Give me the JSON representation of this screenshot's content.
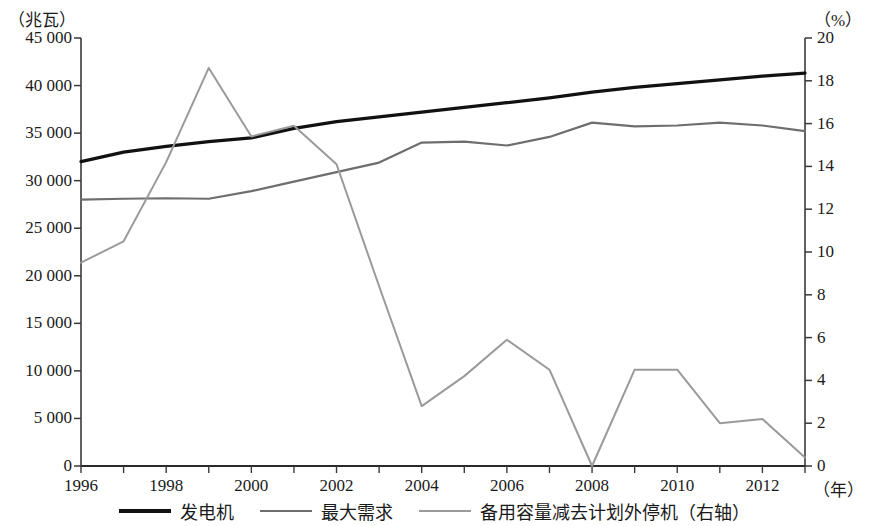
{
  "axes": {
    "left_unit": "（兆瓦）",
    "right_unit": "（%）",
    "x_unit": "（年）",
    "left_ticks": [
      "0",
      "5 000",
      "10 000",
      "15 000",
      "20 000",
      "25 000",
      "30 000",
      "35 000",
      "40 000",
      "45 000"
    ],
    "right_ticks": [
      "0",
      "2",
      "4",
      "6",
      "8",
      "10",
      "12",
      "14",
      "16",
      "18",
      "20"
    ],
    "x_ticks": [
      "1996",
      "1998",
      "2000",
      "2002",
      "2004",
      "2006",
      "2008",
      "2010",
      "2012"
    ]
  },
  "legend": {
    "items": [
      {
        "label": "发电机",
        "style": "thick",
        "color": "#111111"
      },
      {
        "label": "最大需求",
        "style": "medium",
        "color": "#6e6e6e"
      },
      {
        "label": "备用容量减去计划外停机（右轴）",
        "style": "thin",
        "color": "#9a9a9a"
      }
    ]
  },
  "chart_data": {
    "type": "line",
    "title": "",
    "xlabel": "（年）",
    "ylabel": "（兆瓦）",
    "y2label": "（%）",
    "grid": false,
    "legend_position": "bottom",
    "x": [
      1996,
      1997,
      1998,
      1999,
      2000,
      2001,
      2002,
      2003,
      2004,
      2005,
      2006,
      2007,
      2008,
      2009,
      2010,
      2011,
      2012,
      2013
    ],
    "xlim": [
      1996,
      2013
    ],
    "ylim": [
      0,
      45000
    ],
    "y2lim": [
      0,
      20
    ],
    "series": [
      {
        "name": "发电机",
        "axis": "left",
        "color": "#111111",
        "width": 3.2,
        "values": [
          32000,
          33000,
          33600,
          34100,
          34500,
          35500,
          36200,
          36700,
          37200,
          37700,
          38200,
          38700,
          39300,
          39800,
          40200,
          40600,
          41000,
          41300
        ]
      },
      {
        "name": "最大需求",
        "axis": "left",
        "color": "#6e6e6e",
        "width": 2.2,
        "values": [
          28000,
          28100,
          28150,
          28100,
          28900,
          29900,
          30900,
          31900,
          34000,
          34100,
          33700,
          34600,
          36100,
          35700,
          35800,
          36100,
          35800,
          35200
        ]
      },
      {
        "name": "备用容量减去计划外停机（右轴）",
        "axis": "right",
        "color": "#9a9a9a",
        "width": 2.0,
        "values": [
          9.5,
          10.5,
          14.2,
          18.6,
          15.4,
          15.9,
          14.1,
          8.4,
          2.8,
          4.2,
          5.9,
          4.5,
          0.0,
          4.5,
          4.5,
          2.0,
          2.2,
          0.4
        ]
      }
    ]
  }
}
